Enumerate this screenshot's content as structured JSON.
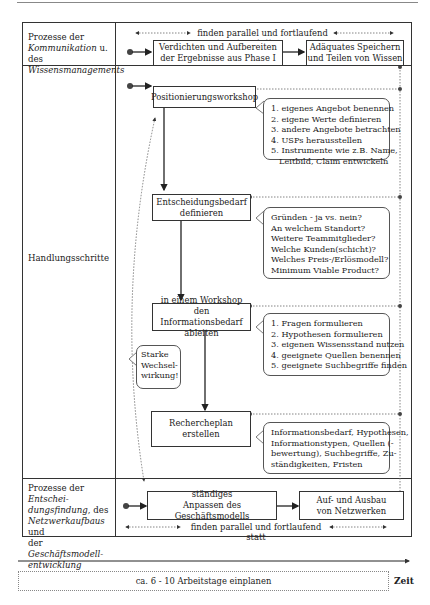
{
  "rows": {
    "communication": {
      "label_parts": [
        "Prozesse der",
        "Kommunikation",
        " u. des",
        "Wissensmanagements"
      ],
      "parallel_note": "finden parallel und fortlaufend statt",
      "steps": [
        "Verdichten und Aufbereiten der Ergebnisse aus Phase I",
        "Adäquates Speichern und Teilen von Wissen"
      ]
    },
    "actions": {
      "label": "Handlungsschritte",
      "steps": [
        {
          "title": "Positionierungsworkshop",
          "details": [
            "1. eigenes Angebot benennen",
            "2. eigene Werte definieren",
            "3. andere Angebote betrachten",
            "4. USPs herausstellen",
            "5. Instrumente wie z.B. Name,",
            "Leitbild, Claim entwickeln"
          ]
        },
        {
          "title": "Entscheidungsbedarf definieren",
          "details": [
            "Gründen - ja vs. nein?",
            "An welchem Standort?",
            "Weitere Teammitglieder?",
            "Welche Kunden(schicht)?",
            "Welches Preis-/Erlösmodell?",
            "Minimum Viable Product?"
          ]
        },
        {
          "title": "in einem Workshop den Informationsbedarf ableiten",
          "details": [
            "1. Fragen formulieren",
            "2. Hypothesen formulieren",
            "3. eigenen Wissensstand nutzen",
            "4. geeignete Quellen benennen",
            "5. geeignete Suchbegriffe finden"
          ]
        },
        {
          "title": "Rechercheplan erstellen",
          "details": [
            "Informationsbedarf, Hypothesen,",
            "Informationstypen, Quellen (-",
            "bewertung), Suchbegriffe, Zu-",
            "ständigkeiten, Fristen"
          ]
        }
      ],
      "interaction_note": [
        "Starke",
        "Wechsel-",
        "wirkung!"
      ]
    },
    "decision": {
      "label_parts": [
        "Prozesse der ",
        "Entschei-",
        "dungsfindung",
        ", des",
        "Netzwerkaufbaus",
        " und",
        "der ",
        "Geschäftsmodell-",
        "entwicklung"
      ],
      "steps": [
        "ständiges Anpassen des Geschäftsmodells",
        "Auf- und Ausbau von Netzwerken"
      ],
      "parallel_note": "finden parallel und fortlaufend statt"
    }
  },
  "timeline": {
    "duration": "ca. 6 - 10 Arbeitstage einplanen",
    "axis_label": "Zeit"
  }
}
